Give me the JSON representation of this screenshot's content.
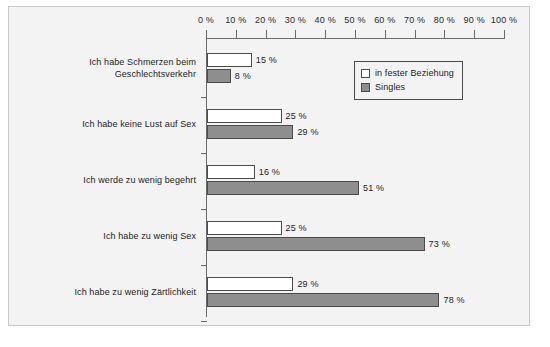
{
  "chart_data": {
    "type": "bar",
    "orientation": "horizontal",
    "title": "",
    "xlabel": "",
    "ylabel": "",
    "xlim": [
      0,
      100
    ],
    "grid": false,
    "legend_position": "top-right",
    "tick_labels": [
      "0 %",
      "10 %",
      "20 %",
      "30 %",
      "40 %",
      "50 %",
      "60 %",
      "70 %",
      "80 %",
      "90 %",
      "100 %"
    ],
    "tick_values": [
      0,
      10,
      20,
      30,
      40,
      50,
      60,
      70,
      80,
      90,
      100
    ],
    "categories": [
      "Ich habe Schmerzen beim Geschlechtsverkehr",
      "Ich habe keine Lust auf Sex",
      "Ich werde zu wenig begehrt",
      "Ich habe zu wenig Sex",
      "Ich habe zu wenig Zärtlichkeit"
    ],
    "category_lines": [
      [
        "Ich habe Schmerzen beim",
        "Geschlechtsverkehr"
      ],
      [
        "Ich habe keine Lust auf Sex"
      ],
      [
        "Ich werde zu wenig begehrt"
      ],
      [
        "Ich habe zu wenig Sex"
      ],
      [
        "Ich habe zu wenig Zärtlichkeit"
      ]
    ],
    "series": [
      {
        "name": "in fester Beziehung",
        "color": "#ffffff",
        "values": [
          15,
          25,
          16,
          25,
          29
        ],
        "value_labels": [
          "15 %",
          "25 %",
          "16 %",
          "25 %",
          "29 %"
        ]
      },
      {
        "name": "Singles",
        "color": "#8e8e8e",
        "values": [
          8,
          29,
          51,
          73,
          78
        ],
        "value_labels": [
          "8 %",
          "29 %",
          "51 %",
          "73 %",
          "78 %"
        ]
      }
    ]
  },
  "legend": {
    "items": [
      {
        "label": "in fester Beziehung",
        "swatch": "relationship"
      },
      {
        "label": "Singles",
        "swatch": "singles"
      }
    ]
  },
  "colors": {
    "background": "#f3f3f3",
    "frame_border": "#c9c9c9",
    "axis": "#6b6b6b",
    "bar_border": "#4a4a4a",
    "series_relationship": "#ffffff",
    "series_singles": "#8e8e8e",
    "text": "#1c1c1c"
  }
}
